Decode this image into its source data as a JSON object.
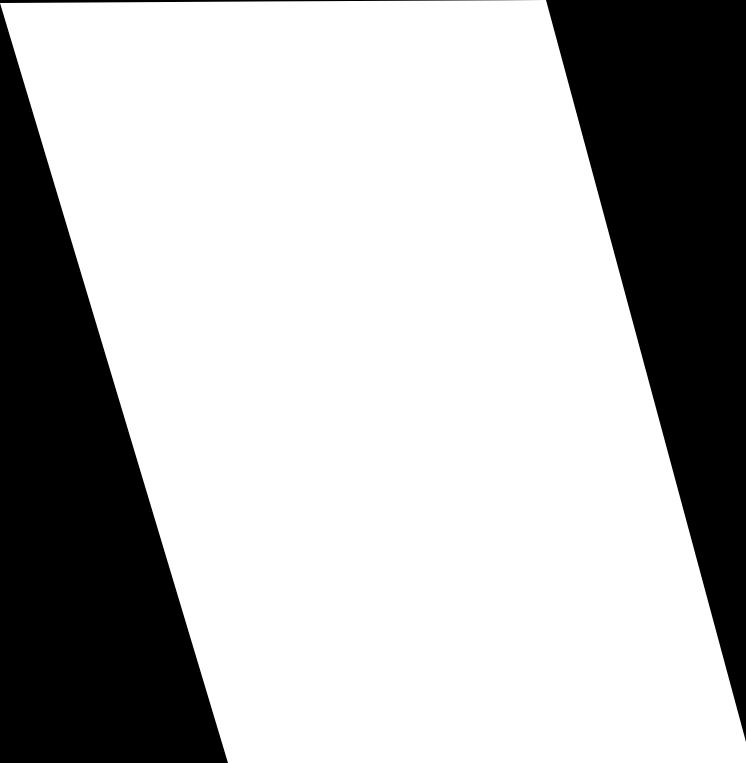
{
  "scene": {
    "background_color": "#000000",
    "shape": {
      "type": "parallelogram",
      "fill_color": "#ffffff",
      "points": "0,3 546,0 746,742 746,763 228,763"
    }
  }
}
